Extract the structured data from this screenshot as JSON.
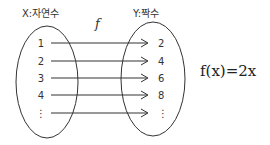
{
  "diagram": {
    "type": "function-mapping",
    "domain_label": "X:자연수",
    "codomain_label": "Y:짝수",
    "function_name": "f",
    "formula": "f(x)=2x",
    "domain_values": [
      "1",
      "2",
      "3",
      "4",
      "⋮"
    ],
    "codomain_values": [
      "2",
      "4",
      "6",
      "8",
      "⋮"
    ],
    "mappings": [
      {
        "from": "1",
        "to": "2"
      },
      {
        "from": "2",
        "to": "4"
      },
      {
        "from": "3",
        "to": "6"
      },
      {
        "from": "4",
        "to": "8"
      },
      {
        "from": "⋮",
        "to": "⋮"
      }
    ],
    "ink_color": "#333333"
  }
}
